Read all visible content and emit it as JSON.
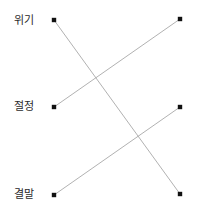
{
  "diagram": {
    "type": "matching-line-diagram",
    "background_color": "#ffffff",
    "line_color": "#a8a8a8",
    "node_color": "#111111",
    "label_color": "#2b2b2b",
    "left_labels": [
      {
        "text": "위기",
        "x": 14,
        "y": 14
      },
      {
        "text": "절정",
        "x": 14,
        "y": 100
      },
      {
        "text": "결말",
        "x": 14,
        "y": 188
      }
    ],
    "nodes": {
      "left": [
        {
          "id": "L1",
          "label": "위기",
          "x": 54,
          "y": 20
        },
        {
          "id": "L2",
          "label": "절정",
          "x": 54,
          "y": 107
        },
        {
          "id": "L3",
          "label": "결말",
          "x": 54,
          "y": 195
        }
      ],
      "right": [
        {
          "id": "R1",
          "x": 180,
          "y": 19
        },
        {
          "id": "R2",
          "x": 180,
          "y": 107
        },
        {
          "id": "R3",
          "x": 180,
          "y": 194
        }
      ]
    },
    "connections": [
      {
        "from": "L1",
        "to": "R3",
        "x1": 54,
        "y1": 20,
        "x2": 180,
        "y2": 194
      },
      {
        "from": "L2",
        "to": "R1",
        "x1": 54,
        "y1": 107,
        "x2": 180,
        "y2": 19
      },
      {
        "from": "L3",
        "to": "R2",
        "x1": 54,
        "y1": 195,
        "x2": 180,
        "y2": 107
      }
    ]
  }
}
